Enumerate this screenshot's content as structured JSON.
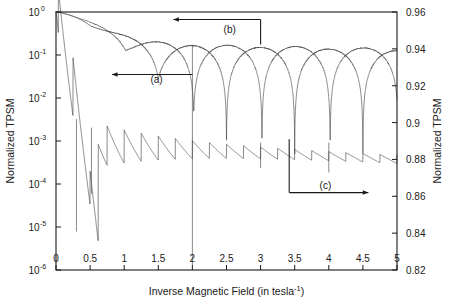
{
  "chart_data": {
    "type": "line",
    "title": "",
    "xlabel": "Inverse Magnetic Field (in tesla−1)",
    "xlabel_base": "Inverse Magnetic Field (in tesla",
    "xlabel_sup": "-1",
    "xlabel_tail": ")",
    "ylabel_left": "Normalized TPSM",
    "ylabel_right": "Normalized TPSM",
    "xlim": [
      0,
      5
    ],
    "xticks": [
      0,
      0.5,
      1,
      1.5,
      2,
      2.5,
      3,
      3.5,
      4,
      4.5,
      5
    ],
    "xticklabels": [
      "0",
      "0.5",
      "1",
      "1.5",
      "2",
      "2.5",
      "3",
      "3.5",
      "4",
      "4.5",
      "5"
    ],
    "left_axis": {
      "scale": "log",
      "ylim": [
        1e-06,
        1
      ],
      "ticks": [
        1,
        0.1,
        0.01,
        0.001,
        0.0001,
        1e-05,
        1e-06
      ],
      "ticklabels": [
        "10",
        "10",
        "10",
        "10",
        "10",
        "10",
        "10"
      ],
      "tick_exponents": [
        "0",
        "-1",
        "-2",
        "-3",
        "-4",
        "-5",
        "-6"
      ]
    },
    "right_axis": {
      "scale": "linear",
      "ylim": [
        0.82,
        0.96
      ],
      "ticks": [
        0.82,
        0.84,
        0.86,
        0.88,
        0.9,
        0.92,
        0.94,
        0.96
      ],
      "ticklabels": [
        "0.82",
        "0.84",
        "0.86",
        "0.88",
        "0.9",
        "0.92",
        "0.94",
        "0.96"
      ]
    },
    "grid": false,
    "legend": "none",
    "annotations": [
      {
        "label": "(a)",
        "target_curve": "a",
        "arrow_direction": "left",
        "x_text": 2.0,
        "y_text_left": 0.027
      },
      {
        "label": "(b)",
        "target_curve": "b",
        "arrow_direction": "left",
        "x_text": 3.0,
        "y_text_left": 0.46
      },
      {
        "label": "(c)",
        "target_curve": "c",
        "arrow_direction": "right",
        "x_text": 4.1,
        "y_right": 0.862
      }
    ],
    "series": [
      {
        "name": "a",
        "axis": "left",
        "description": "Envelope decaying from 1 with deep periodic minima at integer-spaced inverse field values",
        "dip_positions": [
          1.0,
          1.5,
          2.0,
          3.0,
          4.0,
          4.6
        ],
        "dip_depths": [
          0.01,
          0.006,
          1.2e-06,
          0.005,
          0.0085,
          0.006
        ],
        "plateau_levels": [
          0.18,
          0.17,
          0.16,
          0.135,
          0.13
        ]
      },
      {
        "name": "b",
        "axis": "left",
        "description": "Upper envelope curve with shallower minima, slightly offset in phase from curve a",
        "dip_positions": [
          1.55,
          2.55,
          3.55,
          4.55
        ],
        "plateau_levels": [
          0.19,
          0.175,
          0.155,
          0.14
        ]
      },
      {
        "name": "c",
        "axis": "right",
        "description": "Sawtooth oscillation decaying from 1 toward a steady ripple near 0.88 on the right axis",
        "steady_level_right": 0.881,
        "ripple_amplitude_right": 0.004,
        "sawtooth_period": 0.25,
        "deep_spike_positions": [
          2.0,
          3.0,
          4.0
        ]
      }
    ]
  }
}
